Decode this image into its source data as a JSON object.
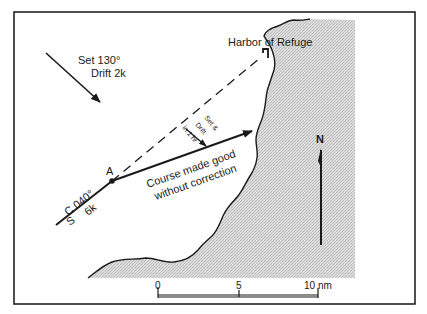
{
  "labels": {
    "current": {
      "line1": "Set 130°",
      "line2": "Drift 2k"
    },
    "harbor": "Harbor of Refuge",
    "set_drift_vector": {
      "line1": "Set &",
      "line2": "Drift",
      "line3": "in 1 hr"
    },
    "point": "A",
    "course": {
      "heading": "C 040°",
      "speed_prefix": "S",
      "speed": "6k"
    },
    "cmg": {
      "line1": "Course made good",
      "line2": "without correction"
    },
    "north": "N"
  },
  "scale_bar": {
    "ticks": [
      "0",
      "5",
      "10 nm"
    ]
  },
  "colors": {
    "ink": "#1a1a1a",
    "land": "#d6d6d6",
    "frame": "#222222",
    "background": "#ffffff"
  }
}
